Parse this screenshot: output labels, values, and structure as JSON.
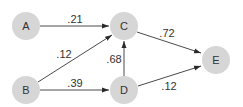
{
  "diagram": {
    "type": "directed-weighted-graph",
    "node_color": "#d6d6d6",
    "edge_color": "#4a4a4a",
    "nodes": [
      {
        "id": "A",
        "label": "A",
        "x": 26,
        "y": 26
      },
      {
        "id": "B",
        "label": "B",
        "x": 26,
        "y": 90
      },
      {
        "id": "C",
        "label": "C",
        "x": 124,
        "y": 26
      },
      {
        "id": "D",
        "label": "D",
        "x": 124,
        "y": 90
      },
      {
        "id": "E",
        "label": "E",
        "x": 216,
        "y": 60
      }
    ],
    "edges": [
      {
        "from": "A",
        "to": "C",
        "weight": ".21"
      },
      {
        "from": "B",
        "to": "C",
        "weight": ".12"
      },
      {
        "from": "B",
        "to": "D",
        "weight": ".39"
      },
      {
        "from": "D",
        "to": "C",
        "weight": ".68"
      },
      {
        "from": "C",
        "to": "E",
        "weight": ".72"
      },
      {
        "from": "D",
        "to": "E",
        "weight": ".12"
      }
    ]
  }
}
